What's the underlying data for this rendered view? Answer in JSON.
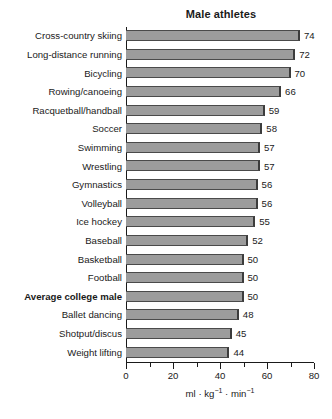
{
  "chart_data": {
    "type": "bar",
    "orientation": "horizontal",
    "title": "Male athletes",
    "xlabel": "ml · kg⁻¹ · min⁻¹",
    "ylabel": "",
    "xlim": [
      0,
      80
    ],
    "grid": false,
    "legend": null,
    "bar_color": "#9c9c9c",
    "bar_edge_color": "#3c3c3c",
    "text_color": "#1a1a1a",
    "background_color": "#ffffff",
    "x_major_ticks": [
      0,
      20,
      40,
      60,
      80
    ],
    "x_minor_ticks": [
      10,
      30,
      50,
      70
    ],
    "x_tick_labels": [
      "0",
      "20",
      "40",
      "60",
      "80"
    ],
    "categories": [
      "Cross-country skiing",
      "Long-distance running",
      "Bicycling",
      "Rowing/canoeing",
      "Racquetball/handball",
      "Soccer",
      "Swimming",
      "Wrestling",
      "Gymnastics",
      "Volleyball",
      "Ice hockey",
      "Baseball",
      "Basketball",
      "Football",
      "Average college male",
      "Ballet dancing",
      "Shotput/discus",
      "Weight lifting"
    ],
    "values": [
      74,
      72,
      70,
      66,
      59,
      58,
      57,
      57,
      56,
      56,
      55,
      52,
      50,
      50,
      50,
      48,
      45,
      44
    ],
    "value_labels": [
      "74",
      "72",
      "70",
      "66",
      "59",
      "58",
      "57",
      "57",
      "56",
      "56",
      "55",
      "52",
      "50",
      "50",
      "50",
      "48",
      "45",
      "44"
    ],
    "emphasized_categories": [
      "Average college male"
    ]
  },
  "axis_title_parts": {
    "ml": "ml",
    "sep1": "·",
    "kg": "kg",
    "kg_exp": "−1",
    "sep2": "·",
    "min": "min",
    "min_exp": "−1"
  }
}
